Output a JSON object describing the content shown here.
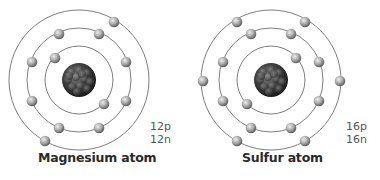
{
  "atoms": [
    {
      "name": "Magnesium atom",
      "protons": "12p",
      "neutrons": "12n",
      "center": [
        79,
        80
      ],
      "shells": [
        34,
        52,
        70
      ],
      "electrons": [
        [
          55,
          58
        ],
        [
          104,
          104
        ],
        [
          59,
          34
        ],
        [
          99,
          34
        ],
        [
          32,
          62
        ],
        [
          126,
          62
        ],
        [
          32,
          101
        ],
        [
          126,
          101
        ],
        [
          59,
          128
        ],
        [
          99,
          128
        ],
        [
          114,
          22
        ],
        [
          45,
          141
        ]
      ],
      "electrons_per_shell": [
        2,
        8,
        2
      ]
    },
    {
      "name": "Sulfur atom",
      "protons": "16p",
      "neutrons": "16n",
      "center": [
        271,
        80
      ],
      "shells": [
        34,
        52,
        70
      ],
      "electrons": [
        [
          296,
          58
        ],
        [
          247,
          104
        ],
        [
          251,
          34
        ],
        [
          291,
          34
        ],
        [
          223,
          62
        ],
        [
          319,
          62
        ],
        [
          223,
          101
        ],
        [
          319,
          101
        ],
        [
          251,
          128
        ],
        [
          291,
          128
        ],
        [
          237,
          22
        ],
        [
          305,
          22
        ],
        [
          203,
          81
        ],
        [
          340,
          81
        ],
        [
          237,
          141
        ],
        [
          305,
          141
        ]
      ],
      "electrons_per_shell": [
        2,
        8,
        6
      ]
    }
  ],
  "colors": {
    "orbit": "#6e6e6e",
    "electron_light": "#e0e0e0",
    "electron_dark": "#6a6a6a",
    "nucleus_light": "#8a8a8a",
    "nucleus_dark": "#1e1e1e",
    "label": "#2a2a2a",
    "counts": "#555555"
  }
}
